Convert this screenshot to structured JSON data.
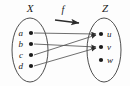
{
  "diagram": {
    "type": "function-mapping-diagram",
    "domain_set": {
      "label": "X",
      "label_x": 30,
      "label_y": 12,
      "ellipse": {
        "cx": 30,
        "cy": 50,
        "rx": 18,
        "ry": 32
      },
      "elements": [
        {
          "name": "a",
          "dot_x": 31,
          "dot_y": 33,
          "label_x": 23,
          "label_y": 36
        },
        {
          "name": "b",
          "dot_x": 31,
          "dot_y": 44,
          "label_x": 23,
          "label_y": 47
        },
        {
          "name": "c",
          "dot_x": 31,
          "dot_y": 55,
          "label_x": 23,
          "label_y": 58
        },
        {
          "name": "d",
          "dot_x": 31,
          "dot_y": 66,
          "label_x": 23,
          "label_y": 69
        }
      ]
    },
    "codomain_set": {
      "label": "Z",
      "label_x": 105,
      "label_y": 12,
      "ellipse": {
        "cx": 104,
        "cy": 50,
        "rx": 17,
        "ry": 32
      },
      "elements": [
        {
          "name": "u",
          "dot_x": 101,
          "dot_y": 34,
          "label_x": 107,
          "label_y": 37
        },
        {
          "name": "v",
          "dot_x": 101,
          "dot_y": 47,
          "label_x": 107,
          "label_y": 50
        },
        {
          "name": "w",
          "dot_x": 101,
          "dot_y": 60,
          "label_x": 107,
          "label_y": 63
        }
      ]
    },
    "function_label": {
      "text": "f",
      "x": 63,
      "y": 13
    },
    "function_arrow": {
      "x1": 55,
      "y1": 20,
      "x2": 79,
      "y2": 23
    },
    "mappings": [
      {
        "from": "a",
        "to": "u",
        "x1": 34,
        "y1": 33,
        "x2": 96,
        "y2": 34
      },
      {
        "from": "b",
        "to": "v",
        "x1": 34,
        "y1": 44,
        "x2": 96,
        "y2": 47
      },
      {
        "from": "c",
        "to": "u",
        "x1": 34,
        "y1": 55,
        "x2": 96,
        "y2": 35
      },
      {
        "from": "d",
        "to": "v",
        "x1": 34,
        "y1": 66,
        "x2": 96,
        "y2": 48
      }
    ],
    "unmapped_elements": [
      "w"
    ],
    "colors": {
      "ink": "#1a1a1a",
      "line": "#555555",
      "background": "#fdfdfd"
    }
  }
}
